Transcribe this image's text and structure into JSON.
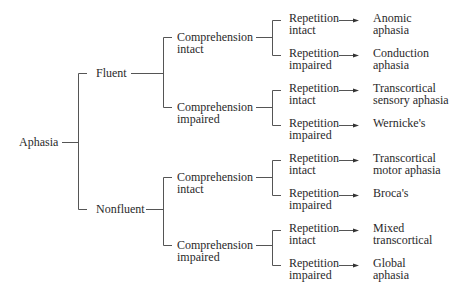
{
  "diagram": {
    "type": "decision-tree",
    "root": "Aphasia",
    "level1": [
      {
        "label": "Fluent"
      },
      {
        "label": "Nonfluent"
      }
    ],
    "level2": [
      {
        "line1": "Comprehension",
        "line2": "intact"
      },
      {
        "line1": "Comprehension",
        "line2": "impaired"
      },
      {
        "line1": "Comprehension",
        "line2": "intact"
      },
      {
        "line1": "Comprehension",
        "line2": "impaired"
      }
    ],
    "level3": [
      {
        "line1": "Repetition",
        "line2": "intact"
      },
      {
        "line1": "Repetition",
        "line2": "impaired"
      },
      {
        "line1": "Repetition",
        "line2": "intact"
      },
      {
        "line1": "Repetition",
        "line2": "impaired"
      },
      {
        "line1": "Repetition",
        "line2": "intact"
      },
      {
        "line1": "Repetition",
        "line2": "impaired"
      },
      {
        "line1": "Repetition",
        "line2": "intact"
      },
      {
        "line1": "Repetition",
        "line2": "impaired"
      }
    ],
    "outcomes": [
      {
        "line1": "Anomic",
        "line2": "aphasia"
      },
      {
        "line1": "Conduction",
        "line2": "aphasia"
      },
      {
        "line1": "Transcortical",
        "line2": "sensory aphasia"
      },
      {
        "line1": "Wernicke's",
        "line2": ""
      },
      {
        "line1": "Transcortical",
        "line2": "motor aphasia"
      },
      {
        "line1": "Broca's",
        "line2": ""
      },
      {
        "line1": "Mixed",
        "line2": "transcortical"
      },
      {
        "line1": "Global",
        "line2": "aphasia"
      }
    ],
    "line_color": "#555555",
    "text_color": "#2a2a2a"
  }
}
